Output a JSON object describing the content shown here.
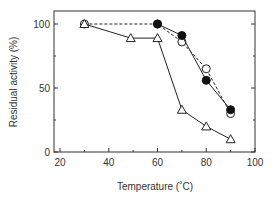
{
  "chart_data": {
    "type": "line",
    "title": "",
    "xlabel": "Temperature (˚C)",
    "ylabel": "Residual activity (%)",
    "xlim": [
      18,
      100
    ],
    "ylim": [
      0,
      110
    ],
    "xticks": [
      20,
      40,
      60,
      80,
      100
    ],
    "yticks": [
      0,
      50,
      100
    ],
    "x_minor_ticks": [
      30,
      50,
      70,
      90
    ],
    "y_minor_ticks": [
      25,
      75
    ],
    "grid": false,
    "legend": null,
    "series": [
      {
        "name": "open-circle",
        "marker": "open-circle",
        "line": "dashed",
        "x": [
          30,
          60,
          70,
          80,
          90
        ],
        "y": [
          100,
          100,
          86,
          65,
          30
        ]
      },
      {
        "name": "filled-circle",
        "marker": "filled-circle",
        "line": "solid",
        "x": [
          60,
          70,
          80,
          90
        ],
        "y": [
          100,
          91,
          56,
          33
        ]
      },
      {
        "name": "open-triangle",
        "marker": "open-triangle",
        "line": "solid",
        "x": [
          30,
          49,
          60,
          70,
          80,
          90
        ],
        "y": [
          100,
          89,
          89,
          33,
          20,
          10
        ]
      }
    ]
  },
  "labels": {
    "x_axis_title": "Temperature (˚C)",
    "y_axis_title": "Residual activity (%)"
  }
}
